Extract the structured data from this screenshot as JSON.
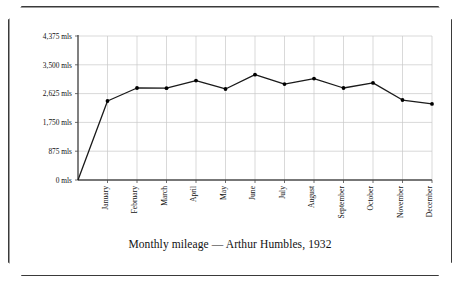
{
  "caption": "Monthly mileage — Arthur Humbles, 1932",
  "colors": {
    "frame": "#3a3a3a",
    "axis": "#4a4a4a",
    "grid": "#c9c9c9",
    "line": "#1a1a1a",
    "marker": "#000000",
    "background": "#ffffff"
  },
  "chart_data": {
    "type": "line",
    "title": "Monthly mileage — Arthur Humbles, 1932",
    "xlabel": "",
    "ylabel": "",
    "categories": [
      "January",
      "February",
      "March",
      "April",
      "May",
      "June",
      "July",
      "August",
      "September",
      "October",
      "November",
      "December"
    ],
    "values": [
      2400,
      2795,
      2790,
      3020,
      2765,
      3200,
      2915,
      3080,
      2795,
      2950,
      2430,
      2310
    ],
    "ylim": [
      0,
      4375
    ],
    "yticks": [
      0,
      875,
      1750,
      2625,
      3500,
      4375
    ],
    "ytick_labels": [
      "0 mls",
      "875 mls",
      "1,750 mls",
      "2,625 mls",
      "3,500 mls",
      "4,375 mls"
    ],
    "grid": true,
    "legend": false,
    "markers": true,
    "origin_value": 0,
    "origin_label": "0 mls"
  }
}
